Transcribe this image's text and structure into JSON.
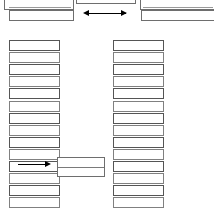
{
  "diagram": {
    "canvas": {
      "width": 214,
      "height": 210,
      "background": "#ffffff"
    },
    "colors": {
      "box_border": "#6e6e6e",
      "thin_border": "#808080",
      "arrow": "#000000",
      "background": "#ffffff"
    },
    "top_row": {
      "label": "top-row",
      "boxes": [
        {
          "name": "top-left-box",
          "label": "",
          "x": 4,
          "y": -6,
          "w": 70,
          "h": 16
        },
        {
          "name": "top-left-box-lower",
          "label": "",
          "x": 9,
          "y": 9,
          "w": 65,
          "h": 11
        },
        {
          "name": "top-middle-box",
          "label": "",
          "x": 76,
          "y": -8,
          "w": 60,
          "h": 12
        },
        {
          "name": "top-right-box",
          "label": "",
          "x": 140,
          "y": -6,
          "w": 74,
          "h": 16
        },
        {
          "name": "top-right-box-lower",
          "label": "",
          "x": 141,
          "y": 9,
          "w": 73,
          "h": 11
        }
      ],
      "arrow": {
        "name": "bidirectional-arrow",
        "label": "",
        "direction": "bidirectional",
        "x_start": 88,
        "x_end": 126,
        "y": 13
      }
    },
    "left_column": {
      "name": "left-column",
      "label": "",
      "x": 9,
      "y": 40,
      "width": 51,
      "row_count": 14,
      "rows": [
        {
          "label": ""
        },
        {
          "label": ""
        },
        {
          "label": ""
        },
        {
          "label": ""
        },
        {
          "label": ""
        },
        {
          "label": ""
        },
        {
          "label": ""
        },
        {
          "label": ""
        },
        {
          "label": ""
        },
        {
          "label": ""
        },
        {
          "label": ""
        },
        {
          "label": ""
        },
        {
          "label": ""
        },
        {
          "label": ""
        }
      ]
    },
    "right_column": {
      "name": "right-column",
      "label": "",
      "x": 113,
      "y": 40,
      "width": 51,
      "row_count": 14,
      "rows": [
        {
          "label": ""
        },
        {
          "label": ""
        },
        {
          "label": ""
        },
        {
          "label": ""
        },
        {
          "label": ""
        },
        {
          "label": ""
        },
        {
          "label": ""
        },
        {
          "label": ""
        },
        {
          "label": ""
        },
        {
          "label": ""
        },
        {
          "label": ""
        },
        {
          "label": ""
        },
        {
          "label": ""
        },
        {
          "label": ""
        }
      ]
    },
    "connector": {
      "name": "middle-connector-box",
      "label": "",
      "x": 57,
      "y": 157,
      "w": 48,
      "h": 19,
      "inner_divider": true,
      "arrow": {
        "name": "right-arrow",
        "label": "",
        "direction": "right",
        "x_start": 18,
        "x_end": 52,
        "y": 164
      }
    }
  }
}
